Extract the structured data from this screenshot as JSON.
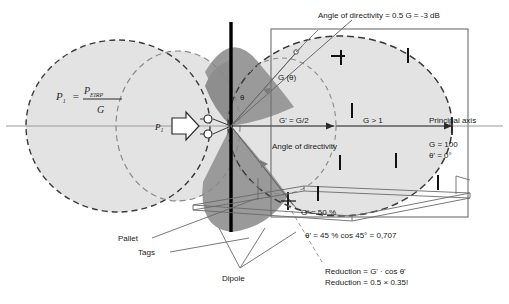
{
  "figure": {
    "colors": {
      "light_lobe": "#e0e0e0",
      "dark_lobe": "#9a9a9a",
      "dashed_stroke": "#3c3c3c",
      "axis_stroke": "#8c8c8c",
      "line_stroke": "#555555",
      "text": "#1a1a1a",
      "tag_mark": "#111111",
      "dipole": "#000000"
    }
  },
  "labels": {
    "angle_of_directivity_top": "Angle of directivity = 0.5 G = -3 dB",
    "angle_of_directivity_inner": "Angle of directivity",
    "g_theta": "G (θ)",
    "theta_symbol": "θ",
    "g_half": "G' = G/2",
    "g_gt_1": "G > 1",
    "principal_axis": "Principal axis",
    "g_100": "G = 100",
    "theta_prime_0": "θ' = 0°",
    "g_prime_50": "G' = 50 %",
    "theta_prime_45": "θ' = 45 %  cos 45° = 0,707",
    "reduction_1": "Reduction = G' · cos θ'",
    "reduction_2": "Reduction = 0.5 × 0.35!",
    "pallet": "Pallet",
    "tags": "Tags",
    "dipole": "Dipole",
    "p1_axis": "P",
    "p1_axis_sub": "1"
  },
  "formula": {
    "lhs": "P",
    "lhs_sub": "1",
    "equals": "=",
    "numerator": "P",
    "numerator_sub": "EIRP",
    "denominator": "G"
  },
  "tag_marks": [
    {
      "x": 341,
      "y": 57,
      "h": 15,
      "rot": 0
    },
    {
      "x": 408,
      "y": 55,
      "h": 15,
      "rot": 0
    },
    {
      "x": 352,
      "y": 110,
      "h": 15,
      "rot": 0
    },
    {
      "x": 340,
      "y": 162,
      "h": 15,
      "rot": 0
    },
    {
      "x": 396,
      "y": 160,
      "h": 15,
      "rot": 0
    },
    {
      "x": 438,
      "y": 182,
      "h": 15,
      "rot": 0
    },
    {
      "x": 318,
      "y": 193,
      "h": 15,
      "rot": 0
    },
    {
      "x": 331,
      "y": 60,
      "h": 8,
      "rot": 90
    }
  ]
}
